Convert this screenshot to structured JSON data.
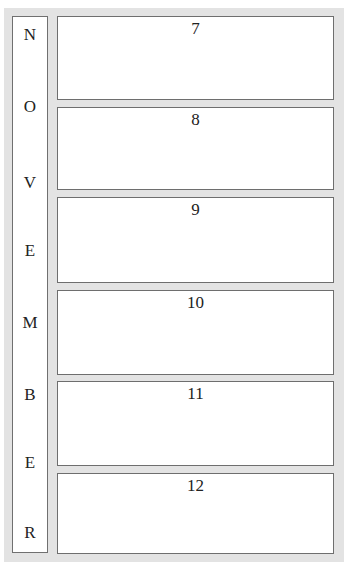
{
  "month": {
    "letters": [
      "N",
      "O",
      "V",
      "E",
      "M",
      "B",
      "E",
      "R"
    ]
  },
  "days": [
    {
      "number": "7"
    },
    {
      "number": "8"
    },
    {
      "number": "9"
    },
    {
      "number": "10"
    },
    {
      "number": "11"
    },
    {
      "number": "12"
    }
  ],
  "colors": {
    "frame": "#e3e3e3",
    "border": "#6e6e6e",
    "background": "#ffffff"
  }
}
